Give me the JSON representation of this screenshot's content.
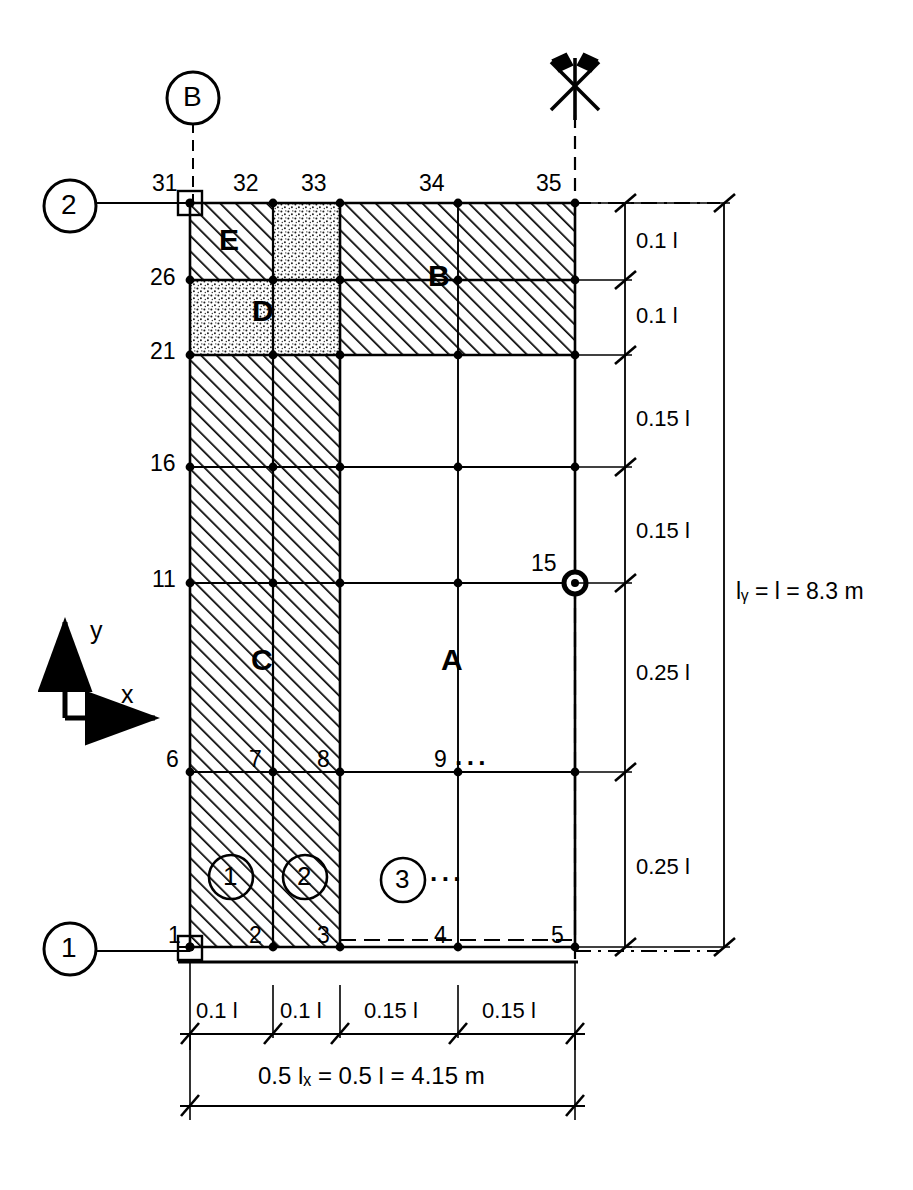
{
  "diagram": {
    "grid_axis_markers": [
      {
        "id": "marker-B",
        "label": "B",
        "x": 193,
        "y": 98
      },
      {
        "id": "marker-2",
        "label": "2",
        "x": 70,
        "y": 206
      },
      {
        "id": "marker-1",
        "label": "1",
        "x": 70,
        "y": 949
      }
    ],
    "node_numbers": [
      {
        "label": "31",
        "x": 160,
        "y": 184
      },
      {
        "label": "32",
        "x": 245,
        "y": 184
      },
      {
        "label": "33",
        "x": 313,
        "y": 184
      },
      {
        "label": "34",
        "x": 430,
        "y": 184
      },
      {
        "label": "35",
        "x": 547,
        "y": 184
      },
      {
        "label": "26",
        "x": 160,
        "y": 278
      },
      {
        "label": "21",
        "x": 160,
        "y": 352
      },
      {
        "label": "16",
        "x": 160,
        "y": 464
      },
      {
        "label": "11",
        "x": 160,
        "y": 580
      },
      {
        "label": "15",
        "x": 547,
        "y": 566
      },
      {
        "label": "6",
        "x": 172,
        "y": 768
      },
      {
        "label": "7",
        "x": 253,
        "y": 768
      },
      {
        "label": "8",
        "x": 322,
        "y": 768
      },
      {
        "label": "9",
        "x": 440,
        "y": 768
      },
      {
        "label": "1",
        "x": 172,
        "y": 944
      },
      {
        "label": "2",
        "x": 253,
        "y": 944
      },
      {
        "label": "3",
        "x": 322,
        "y": 944
      },
      {
        "label": "4",
        "x": 440,
        "y": 944
      },
      {
        "label": "5",
        "x": 557,
        "y": 944
      }
    ],
    "zone_labels": [
      {
        "label": "E",
        "x": 228,
        "y": 243
      },
      {
        "label": "D",
        "x": 262,
        "y": 310
      },
      {
        "label": "B",
        "x": 437,
        "y": 275
      },
      {
        "label": "C",
        "x": 260,
        "y": 660
      },
      {
        "label": "A",
        "x": 450,
        "y": 660
      }
    ],
    "element_numbers": [
      {
        "label": "1",
        "x": 231,
        "y": 877
      },
      {
        "label": "2",
        "x": 305,
        "y": 877
      },
      {
        "label": "3",
        "x": 403,
        "y": 880
      }
    ],
    "ellipses": [
      {
        "label": "···",
        "x": 455,
        "y": 764
      },
      {
        "label": "···",
        "x": 425,
        "y": 878
      }
    ],
    "coordinate_axes": {
      "x_label": "x",
      "y_label": "y"
    },
    "vertical_dimensions": [
      {
        "label": "0.1  l",
        "x": 636,
        "y": 240
      },
      {
        "label": "0.1  l",
        "x": 636,
        "y": 315
      },
      {
        "label": "0.15 l",
        "x": 636,
        "y": 418
      },
      {
        "label": "0.15 l",
        "x": 636,
        "y": 530
      },
      {
        "label": "0.25 l",
        "x": 636,
        "y": 672
      },
      {
        "label": "0.25 l",
        "x": 636,
        "y": 866
      }
    ],
    "horizontal_dimensions": [
      {
        "label": "0.1 l",
        "x": 209,
        "y": 1010
      },
      {
        "label": "0.1 l",
        "x": 284,
        "y": 1010
      },
      {
        "label": "0.15 l",
        "x": 377,
        "y": 1010
      },
      {
        "label": "0.15 l",
        "x": 495,
        "y": 1010
      }
    ],
    "overall_dimensions": {
      "vertical": "lᵧ = l = 8.3 m",
      "vertical_x": 752,
      "vertical_y": 592,
      "horizontal": "0.5 lₓ = 0.5 l = 4.15 m",
      "horizontal_x": 383,
      "horizontal_y": 1080
    },
    "colors": {
      "line": "#000000",
      "hatch": "#000000",
      "stipple": "#000000",
      "background": "#ffffff"
    }
  }
}
